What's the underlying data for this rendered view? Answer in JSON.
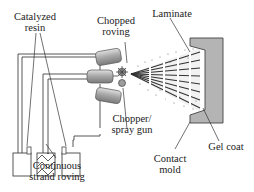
{
  "diagram": {
    "labels": {
      "catalyzed_resin_1": "Catalyzed",
      "catalyzed_resin_2": "resin",
      "chopped_roving_1": "Chopped",
      "chopped_roving_2": "roving",
      "laminate": "Laminate",
      "chopper_gun_1": "Chopper/",
      "chopper_gun_2": "spray gun",
      "gel_coat": "Gel coat",
      "contact_mold_1": "Contact",
      "contact_mold_2": "mold",
      "strand_roving_1": "Continuous",
      "strand_roving_2": "strand roving"
    },
    "colors": {
      "mold_fill": "#b4b4b4",
      "nozzle_fill": "#a8a8a8",
      "line": "#333333"
    }
  }
}
